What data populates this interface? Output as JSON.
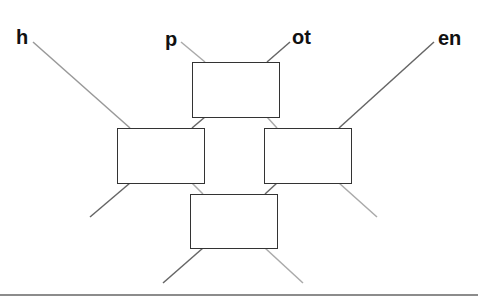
{
  "diagram": {
    "type": "fill-in-the-blank word tree",
    "labels": [
      {
        "id": "label-h",
        "text": "h"
      },
      {
        "id": "label-p",
        "text": "p"
      },
      {
        "id": "label-ot",
        "text": "ot"
      },
      {
        "id": "label-en",
        "text": "en"
      }
    ],
    "boxes": [
      {
        "id": "top-box",
        "text": ""
      },
      {
        "id": "left-box",
        "text": ""
      },
      {
        "id": "right-box",
        "text": ""
      },
      {
        "id": "bottom-box",
        "text": ""
      }
    ],
    "colors": {
      "box_border": "#333333",
      "connector_dark": "#555555",
      "connector_light": "#aaaaaa",
      "label_text": "#111111",
      "divider": "#666666"
    }
  }
}
